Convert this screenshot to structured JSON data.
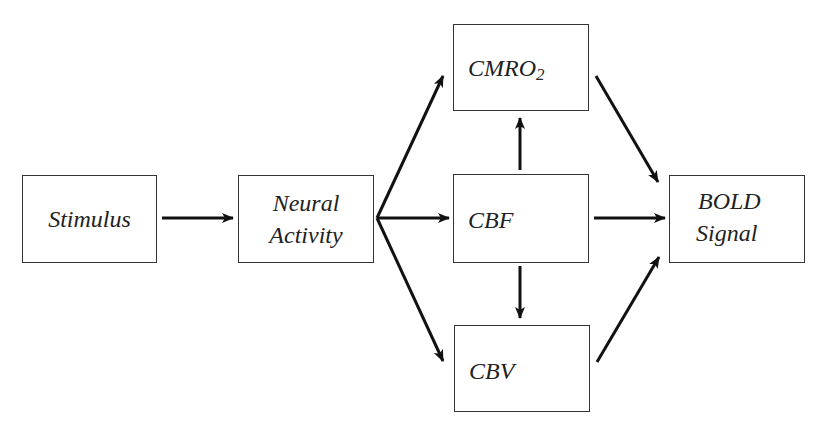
{
  "diagram": {
    "title": "",
    "nodes": [
      {
        "id": "stimulus",
        "label": "Stimulus"
      },
      {
        "id": "neural",
        "line1": "Neural",
        "line2": "Activity"
      },
      {
        "id": "cmro2",
        "label": "CMRO",
        "sub": "2",
        "indicator": "↑"
      },
      {
        "id": "cbf",
        "label": "CBF",
        "indicator": "↑"
      },
      {
        "id": "cbv",
        "label": "CBV",
        "indicator": "↑"
      },
      {
        "id": "bold",
        "line1": "BOLD",
        "line2": "Signal"
      }
    ],
    "edges": [
      {
        "from": "stimulus",
        "to": "neural"
      },
      {
        "from": "neural",
        "to": "cmro2"
      },
      {
        "from": "neural",
        "to": "cbf"
      },
      {
        "from": "neural",
        "to": "cbv"
      },
      {
        "from": "cbf",
        "to": "cmro2"
      },
      {
        "from": "cbf",
        "to": "cbv"
      },
      {
        "from": "cmro2",
        "to": "bold"
      },
      {
        "from": "cbf",
        "to": "bold"
      },
      {
        "from": "cbv",
        "to": "bold"
      }
    ]
  }
}
